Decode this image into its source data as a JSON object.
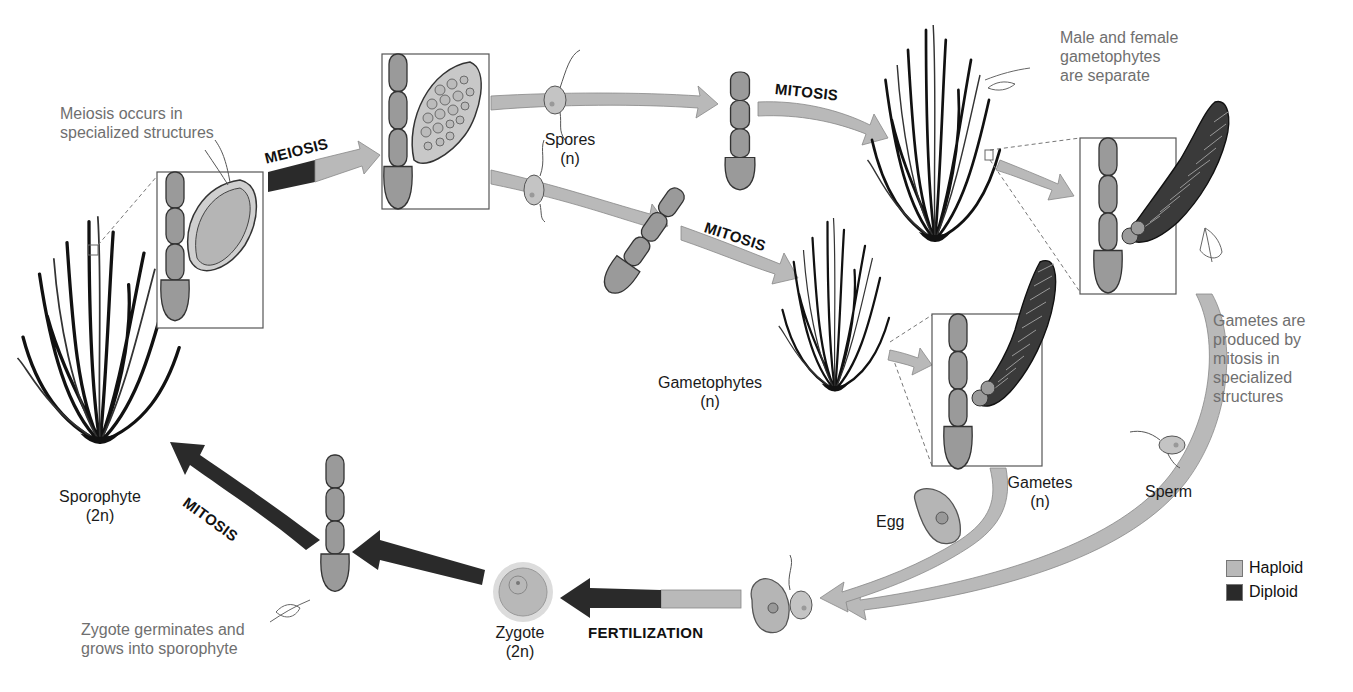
{
  "diagram": {
    "colors": {
      "haploid": "#b9b9b9",
      "diploid": "#2a2a2a",
      "background": "#ffffff",
      "note_text": "#6f6f6f"
    },
    "stages": {
      "sporophyte": {
        "name": "Sporophyte",
        "ploidy": "(2n)"
      },
      "spores": {
        "name": "Spores",
        "ploidy": "(n)"
      },
      "gametophytes": {
        "name": "Gametophytes",
        "ploidy": "(n)"
      },
      "gametes": {
        "name": "Gametes",
        "ploidy": "(n)"
      },
      "egg": {
        "name": "Egg"
      },
      "sperm": {
        "name": "Sperm"
      },
      "zygote": {
        "name": "Zygote",
        "ploidy": "(2n)"
      }
    },
    "processes": {
      "meiosis": "MEIOSIS",
      "mitosis_upper": "MITOSIS",
      "mitosis_lower": "MITOSIS",
      "mitosis_sporophyte": "MITOSIS",
      "fertilization": "FERTILIZATION"
    },
    "notes": {
      "meiosis_note": [
        "Meiosis occurs in",
        "specialized structures"
      ],
      "separate_note": [
        "Male and female",
        "gametophytes",
        "are separate"
      ],
      "gametes_note": [
        "Gametes are",
        "produced by",
        "mitosis in",
        "specialized",
        "structures"
      ],
      "zygote_note": [
        "Zygote germinates and",
        "grows into sporophyte"
      ]
    },
    "legend": [
      {
        "label": "Haploid",
        "color": "#b9b9b9"
      },
      {
        "label": "Diploid",
        "color": "#2a2a2a"
      }
    ]
  }
}
